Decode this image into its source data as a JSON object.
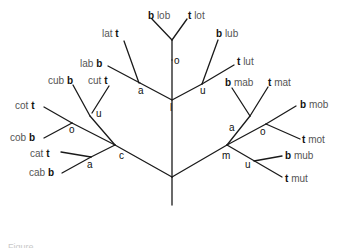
{
  "diagram": {
    "type": "word-formation-tree",
    "colors": {
      "line": "#1a1a1a",
      "letter": "#111111",
      "word": "#555555"
    },
    "nodes": [
      {
        "id": "l",
        "label": "l",
        "x": 172,
        "y": 60
      },
      {
        "id": "c",
        "label": "c",
        "x": 115,
        "y": 145
      },
      {
        "id": "m",
        "label": "m",
        "x": 227,
        "y": 145
      },
      {
        "id": "lo",
        "label": "o",
        "x": 172,
        "y": 40
      },
      {
        "id": "la",
        "label": "a",
        "x": 140,
        "y": 80
      },
      {
        "id": "lu",
        "label": "u",
        "x": 202,
        "y": 82
      },
      {
        "id": "cu",
        "label": "u",
        "x": 90,
        "y": 115
      },
      {
        "id": "co",
        "label": "o",
        "x": 72,
        "y": 107
      },
      {
        "id": "ca",
        "label": "a",
        "x": 91,
        "y": 138
      },
      {
        "id": "ma",
        "label": "a",
        "x": 250,
        "y": 115
      },
      {
        "id": "mo",
        "label": "o",
        "x": 266,
        "y": 123
      },
      {
        "id": "mu",
        "label": "u",
        "x": 254,
        "y": 160
      }
    ],
    "leaves": [
      {
        "letter": "b",
        "word": "lob"
      },
      {
        "letter": "t",
        "word": "lot"
      },
      {
        "letter": "b",
        "word": "lab"
      },
      {
        "letter": "t",
        "word": "lat"
      },
      {
        "letter": "b",
        "word": "lub"
      },
      {
        "letter": "t",
        "word": "lut"
      },
      {
        "letter": "b",
        "word": "cub"
      },
      {
        "letter": "t",
        "word": "cut"
      },
      {
        "letter": "t",
        "word": "cot"
      },
      {
        "letter": "b",
        "word": "cob"
      },
      {
        "letter": "t",
        "word": "cat"
      },
      {
        "letter": "b",
        "word": "cab"
      },
      {
        "letter": "b",
        "word": "mab"
      },
      {
        "letter": "t",
        "word": "mat"
      },
      {
        "letter": "b",
        "word": "mob"
      },
      {
        "letter": "t",
        "word": "mot"
      },
      {
        "letter": "b",
        "word": "mub"
      },
      {
        "letter": "t",
        "word": "mut"
      }
    ],
    "node_labels": {
      "l": "l",
      "c": "c",
      "m": "m",
      "lo": "o",
      "la": "a",
      "lu": "u",
      "cu": "u",
      "co": "o",
      "ca": "a",
      "ma": "a",
      "mo": "o",
      "mu": "u"
    }
  },
  "caption": "Figure"
}
